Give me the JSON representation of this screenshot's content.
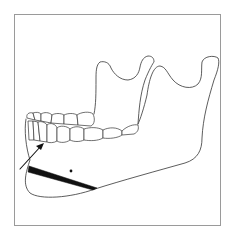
{
  "figure": {
    "type": "anatomical-line-drawing",
    "colors": {
      "background": "#ffffff",
      "frame": "#9a9a9a",
      "line": "#333333",
      "wedge": "#111111"
    },
    "annotations": {
      "arrow": "pointing-up-right-toward-incisor-root",
      "wedge": "black-triangular-wedge-along-lower-border",
      "dot": "single-black-point-marker"
    }
  }
}
